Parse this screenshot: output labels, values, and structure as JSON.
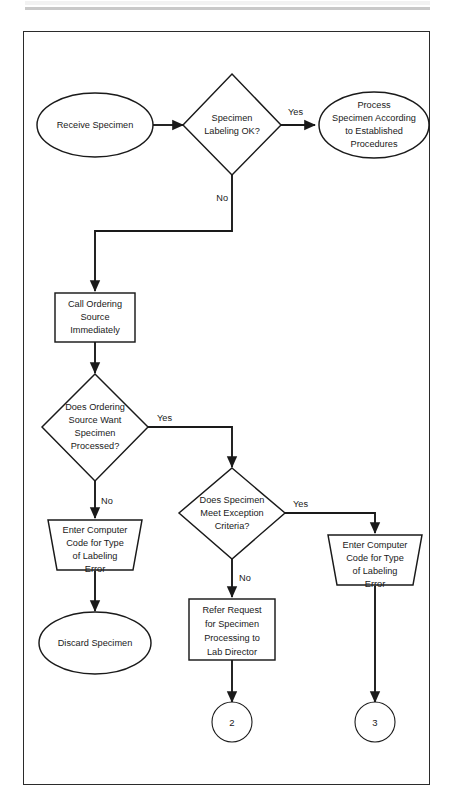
{
  "page": {
    "border_color": "#2b2b2b",
    "rule_color": "#c9c9c9",
    "line_color": "#1a1a1a",
    "background": "#ffffff"
  },
  "diagram": {
    "type": "flowchart",
    "nodes": [
      {
        "id": "receive-specimen",
        "shape": "ellipse",
        "label": "Receive Specimen",
        "lines": [
          "Receive Specimen"
        ]
      },
      {
        "id": "specimen-labeling-ok",
        "shape": "diamond",
        "label": "Specimen Labeling OK?",
        "lines": [
          "Specimen",
          "Labeling OK?"
        ]
      },
      {
        "id": "process-specimen",
        "shape": "ellipse",
        "label": "Process Specimen According to Established Procedures",
        "lines": [
          "Process",
          "Specimen According",
          "to Established",
          "Procedures"
        ]
      },
      {
        "id": "call-ordering-source",
        "shape": "rectangle",
        "label": "Call Ordering Source Immediately",
        "lines": [
          "Call Ordering",
          "Source",
          "Immediately"
        ]
      },
      {
        "id": "source-want-processed",
        "shape": "diamond",
        "label": "Does Ordering Source Want Specimen Processed?",
        "lines": [
          "Does Ordering",
          "Source Want",
          "Specimen",
          "Processed?"
        ]
      },
      {
        "id": "meets-exception-criteria",
        "shape": "diamond",
        "label": "Does Specimen Meet Exception Criteria?",
        "lines": [
          "Does Specimen",
          "Meet Exception",
          "Criteria?"
        ]
      },
      {
        "id": "enter-code-left",
        "shape": "trapezoid",
        "label": "Enter Computer Code for Type of Labeling Error",
        "lines": [
          "Enter Computer",
          "Code for Type",
          "of Labeling",
          "Error"
        ]
      },
      {
        "id": "enter-code-right",
        "shape": "trapezoid",
        "label": "Enter Computer Code for Type of Labeling Error",
        "lines": [
          "Enter Computer",
          "Code for Type",
          "of Labeling",
          "Error"
        ]
      },
      {
        "id": "discard-specimen",
        "shape": "ellipse",
        "label": "Discard  Specimen",
        "lines": [
          "Discard  Specimen"
        ]
      },
      {
        "id": "refer-request",
        "shape": "rectangle",
        "label": "Refer Request for Specimen Processing to Lab Director",
        "lines": [
          "Refer Request",
          "for Specimen",
          "Processing to",
          "Lab Director"
        ]
      },
      {
        "id": "connector-2",
        "shape": "circle",
        "label": "2"
      },
      {
        "id": "connector-3",
        "shape": "circle",
        "label": "3"
      }
    ],
    "edges": [
      {
        "id": "edge-receive-to-labeling",
        "from": "receive-specimen",
        "to": "specimen-labeling-ok",
        "label": ""
      },
      {
        "id": "edge-labeling-yes",
        "from": "specimen-labeling-ok",
        "to": "process-specimen",
        "label": "Yes"
      },
      {
        "id": "edge-labeling-no",
        "from": "specimen-labeling-ok",
        "to": "call-ordering-source",
        "label": "No"
      },
      {
        "id": "edge-call-to-want",
        "from": "call-ordering-source",
        "to": "source-want-processed",
        "label": ""
      },
      {
        "id": "edge-want-yes",
        "from": "source-want-processed",
        "to": "meets-exception-criteria",
        "label": "Yes"
      },
      {
        "id": "edge-want-no",
        "from": "source-want-processed",
        "to": "enter-code-left",
        "label": "No"
      },
      {
        "id": "edge-exception-yes",
        "from": "meets-exception-criteria",
        "to": "enter-code-right",
        "label": "Yes"
      },
      {
        "id": "edge-exception-no",
        "from": "meets-exception-criteria",
        "to": "refer-request",
        "label": "No"
      },
      {
        "id": "edge-code-left-to-discard",
        "from": "enter-code-left",
        "to": "discard-specimen",
        "label": ""
      },
      {
        "id": "edge-refer-to-connector2",
        "from": "refer-request",
        "to": "connector-2",
        "label": ""
      },
      {
        "id": "edge-code-right-to-connector3",
        "from": "enter-code-right",
        "to": "connector-3",
        "label": ""
      }
    ],
    "edge_labels": {
      "labeling_yes": "Yes",
      "labeling_no": "No",
      "want_yes": "Yes",
      "want_no": "No",
      "exception_yes": "Yes",
      "exception_no": "No"
    }
  }
}
